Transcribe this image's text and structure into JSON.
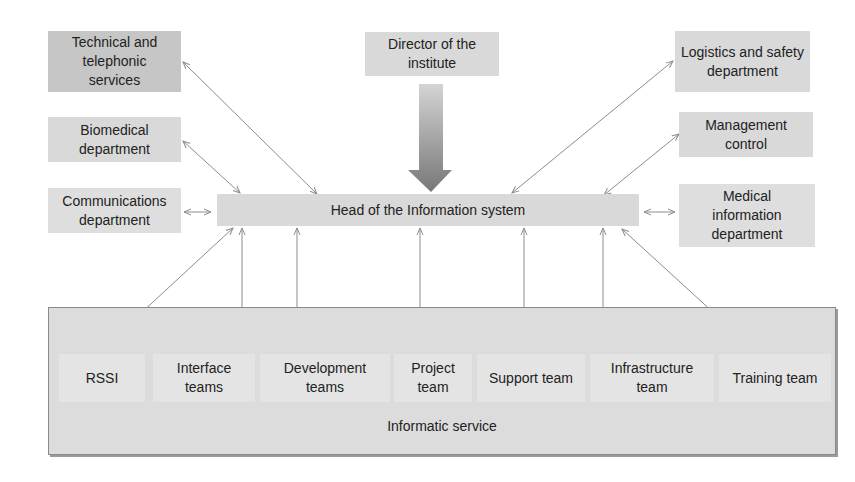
{
  "diagram": {
    "top_center": {
      "label": "Director of the institute"
    },
    "hub": {
      "label": "Head of the Information system"
    },
    "left_nodes": [
      {
        "label": "Technical and telephonic services"
      },
      {
        "label": "Biomedical department"
      },
      {
        "label": "Communications department"
      }
    ],
    "right_nodes": [
      {
        "label": "Logistics and safety department"
      },
      {
        "label": "Management control"
      },
      {
        "label": "Medical information department"
      }
    ],
    "container": {
      "label": "Informatic service",
      "teams": [
        {
          "label": "RSSI"
        },
        {
          "label": "Interface teams"
        },
        {
          "label": "Development teams"
        },
        {
          "label": "Project team"
        },
        {
          "label": "Support team"
        },
        {
          "label": "Infrastructure team"
        },
        {
          "label": "Training team"
        }
      ]
    },
    "colors": {
      "box_fill": "#d9d9d9",
      "dark_box_fill": "#c6c6c6",
      "arrow": "#8c8c8c",
      "big_arrow_top": "#d0d0d0",
      "big_arrow_bottom": "#7a7a7a"
    }
  }
}
